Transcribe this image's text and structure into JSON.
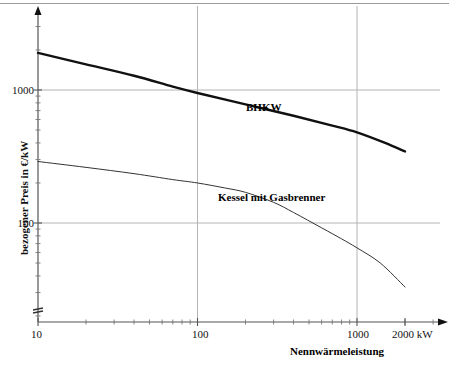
{
  "chart_data": {
    "type": "line",
    "title": "",
    "subtitle": "",
    "xlabel": "Nennwärmeleistung",
    "ylabel": "bezogener Preis in €/kW",
    "xscale": "log",
    "yscale": "log",
    "xlim": [
      10,
      2400
    ],
    "ylim": [
      20,
      3000
    ],
    "grid": true,
    "legend_position": "inline-annotations",
    "x_tick_labels": [
      "10",
      "100",
      "1000",
      "2000 kW"
    ],
    "x_tick_values": [
      10,
      100,
      1000,
      2000
    ],
    "y_tick_labels": [
      "1000",
      "100"
    ],
    "y_tick_values": [
      1000,
      100
    ],
    "x_unit": "kW",
    "y_unit": "€/kW",
    "series": [
      {
        "name": "BHKW",
        "label": "BHKW",
        "color": "#111111",
        "linewidth": 2.4,
        "x": [
          10,
          20,
          40,
          70,
          100,
          200,
          400,
          700,
          1000,
          1500,
          2000
        ],
        "values": [
          1900,
          1560,
          1280,
          1060,
          950,
          780,
          640,
          540,
          480,
          400,
          345
        ]
      },
      {
        "name": "Kessel mit Gasbrenner",
        "label": "Kessel mit Gasbrenner",
        "color": "#333333",
        "linewidth": 1.0,
        "x": [
          10,
          20,
          40,
          70,
          100,
          150,
          200,
          300,
          400,
          600,
          800,
          1000,
          1400,
          2000
        ],
        "values": [
          290,
          262,
          235,
          212,
          200,
          183,
          170,
          143,
          120,
          92,
          76,
          65,
          50,
          33
        ]
      }
    ],
    "annotations": [
      {
        "text": "BHKW",
        "x": 330,
        "y": 830
      },
      {
        "text": "Kessel mit Gasbrenner",
        "x": 270,
        "y": 175
      }
    ]
  },
  "axes": {
    "y_axis_name": "bezogener Preis in €/kW",
    "x_axis_name": "Nennwärmeleistung",
    "y_break_marker": "axis-break",
    "arrow_top": "up-arrow",
    "arrow_right": "right-arrow"
  }
}
